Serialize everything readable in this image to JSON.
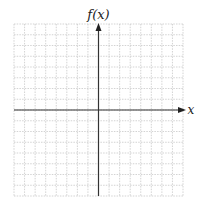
{
  "chart_data": {
    "type": "line",
    "title": "",
    "xlabel": "x",
    "ylabel": "f(x)",
    "series": [],
    "grid": true,
    "grid_cells": {
      "x": 16,
      "y": 16
    },
    "axis_position": {
      "x_axis_row_from_top": 8,
      "y_axis_col_from_left": 8
    },
    "tick_labels": {
      "x": [],
      "y": []
    },
    "colors": {
      "grid": "#c8c8c8",
      "axis": "#333333",
      "background": "#ffffff"
    }
  },
  "labels": {
    "y_axis": "f(x)",
    "x_axis": "x"
  }
}
